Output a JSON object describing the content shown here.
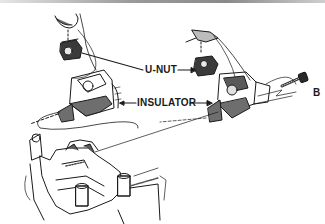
{
  "diagram": {
    "labels": {
      "u_nut": "U-NUT",
      "insulator": "INSULATOR",
      "bolt": "B"
    },
    "colors": {
      "ink": "#1a1a1a",
      "shade": "#6e6e6e",
      "background": "#ffffff"
    }
  }
}
